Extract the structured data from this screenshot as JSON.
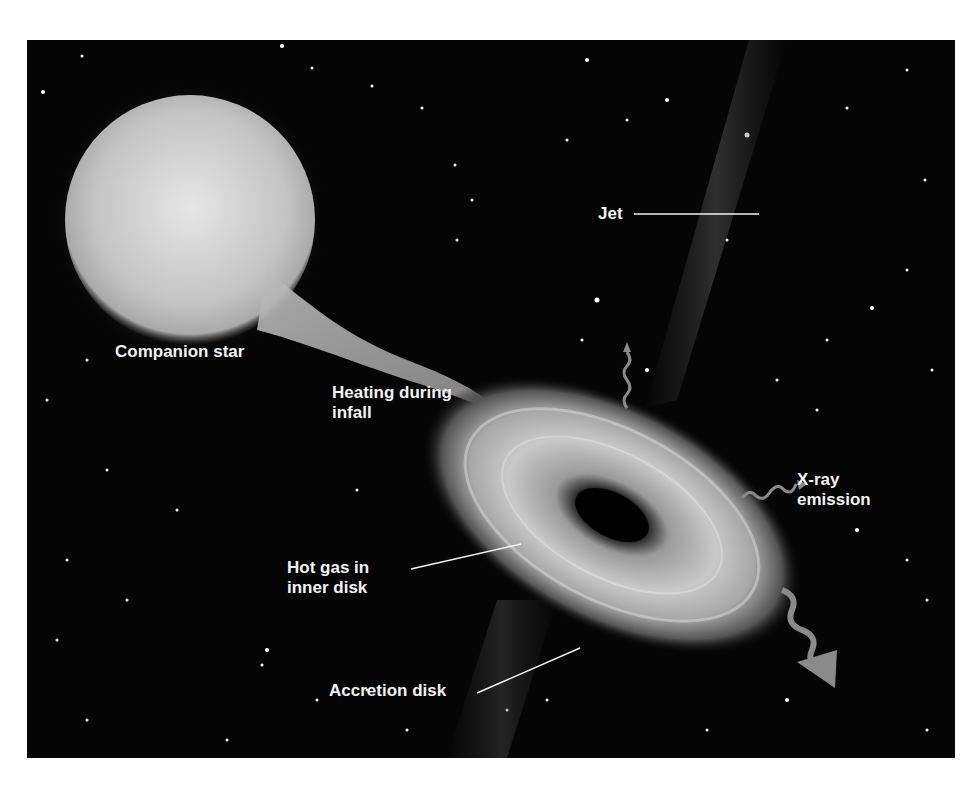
{
  "figure": {
    "labels": {
      "jet": "Jet",
      "companion_star": "Companion star",
      "heating_line1": "Heating during",
      "heating_line2": "infall",
      "xray_line1": "X-ray",
      "xray_line2": "emission",
      "hot_gas_line1": "Hot gas in",
      "hot_gas_line2": "inner disk",
      "accretion_disk": "Accretion disk"
    },
    "colors": {
      "background": "#050505",
      "star": "#c8c8c8",
      "label_text": "#f2f2f2",
      "emission_arrow": "#8a8a8a",
      "border": "#ffffff"
    }
  }
}
